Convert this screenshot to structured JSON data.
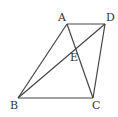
{
  "diagram": {
    "type": "geometry-quadrilateral",
    "points": {
      "A": {
        "label": "A",
        "x": 67,
        "y": 24,
        "label_x": 58,
        "label_y": 21
      },
      "D": {
        "label": "D",
        "x": 105,
        "y": 24,
        "label_x": 106,
        "label_y": 21
      },
      "B": {
        "label": "B",
        "x": 18,
        "y": 98,
        "label_x": 10,
        "label_y": 109
      },
      "C": {
        "label": "C",
        "x": 93,
        "y": 98,
        "label_x": 92,
        "label_y": 109
      },
      "E": {
        "label": "E",
        "x": 75,
        "y": 47,
        "label_x": 70,
        "label_y": 61
      }
    },
    "segments": [
      {
        "name": "AD",
        "from": "A",
        "to": "D"
      },
      {
        "name": "AB",
        "from": "A",
        "to": "B"
      },
      {
        "name": "BC",
        "from": "B",
        "to": "C"
      },
      {
        "name": "DC",
        "from": "D",
        "to": "C"
      },
      {
        "name": "AC",
        "from": "A",
        "to": "C"
      },
      {
        "name": "BD",
        "from": "B",
        "to": "D"
      }
    ],
    "colors": {
      "stroke": "#444444",
      "label": "#333333",
      "background": "#ffffff"
    }
  }
}
